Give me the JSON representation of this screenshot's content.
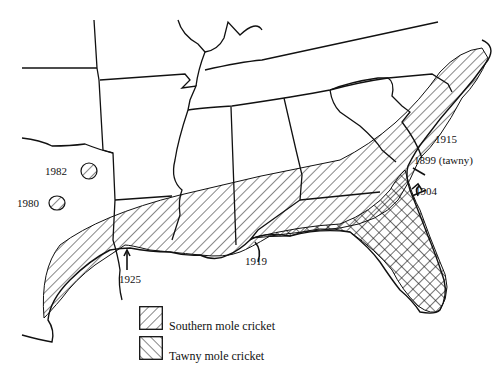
{
  "map": {
    "title": "",
    "region": "Southeastern United States",
    "colors": {
      "line": "#111111",
      "background": "#ffffff"
    },
    "annotations": [
      {
        "id": "1982",
        "label": "1982",
        "type": "isolated-record"
      },
      {
        "id": "1980",
        "label": "1980",
        "type": "isolated-record"
      },
      {
        "id": "1925",
        "label": "1925",
        "type": "introduction-arrow"
      },
      {
        "id": "1919",
        "label": "1919",
        "type": "introduction-arrow"
      },
      {
        "id": "1915",
        "label": "1915",
        "type": "introduction-arrow"
      },
      {
        "id": "1899",
        "label": "1899 (tawny)",
        "type": "introduction-arrow"
      },
      {
        "id": "1904",
        "label": "1904",
        "type": "introduction-arrow"
      }
    ]
  },
  "legend": {
    "items": [
      {
        "label": "Southern mole cricket",
        "pattern": "forward-hatch"
      },
      {
        "label": "Tawny mole cricket",
        "pattern": "back-hatch"
      }
    ]
  }
}
